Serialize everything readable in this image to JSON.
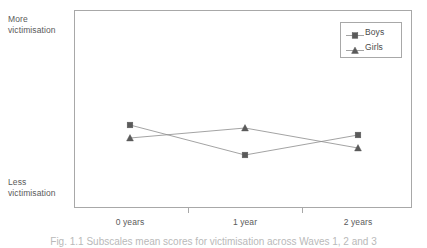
{
  "figure": {
    "y_anchor_top": "More\nvictimisation",
    "y_anchor_top_line1": "More",
    "y_anchor_top_line2": "victimisation",
    "y_anchor_bottom_line1": "Less",
    "y_anchor_bottom_line2": "victimisation",
    "caption": "Fig. 1.1  Subscales mean scores for victimisation across Waves 1, 2 and 3"
  },
  "legend": {
    "position": "top-right",
    "entries": [
      {
        "label": "Boys",
        "marker": "square",
        "color": "#5a5a5a"
      },
      {
        "label": "Girls",
        "marker": "triangle",
        "color": "#5a5a5a"
      }
    ]
  },
  "colors": {
    "line": "#8c8c8c",
    "marker": "#5a5a5a",
    "frame": "#a8a8a8",
    "text": "#5a5a5a"
  },
  "chart_data": {
    "type": "line",
    "title": "",
    "subtitle": "",
    "xlabel": "",
    "ylabel": "",
    "categories": [
      "0 years",
      "1 year",
      "2 years"
    ],
    "x_positions_px": [
      130,
      245,
      358
    ],
    "ylim": [
      0,
      1
    ],
    "ylim_labels": [
      "Less victimisation",
      "More victimisation"
    ],
    "y_axis_ticks": [],
    "grid": false,
    "legend_position": "top-right",
    "series": [
      {
        "name": "Boys",
        "marker": "square",
        "color": "#5a5a5a",
        "values": [
          0.42,
          0.28,
          0.37
        ],
        "y_positions_px": [
          125,
          155,
          135
        ]
      },
      {
        "name": "Girls",
        "marker": "triangle",
        "color": "#5a5a5a",
        "values": [
          0.35,
          0.41,
          0.31
        ],
        "y_positions_px": [
          138,
          128,
          148
        ]
      }
    ],
    "annotations": []
  }
}
